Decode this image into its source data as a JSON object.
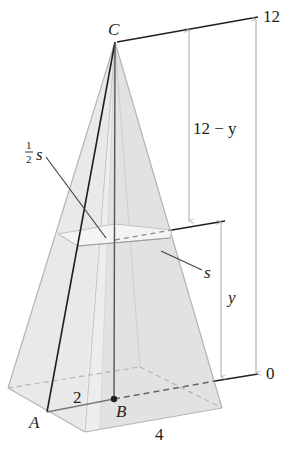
{
  "figure": {
    "labels": {
      "apex": "C",
      "base_corner": "A",
      "base_center": "B",
      "half_base": "2",
      "base_side": "4",
      "cross_section_half_num": "1",
      "cross_section_half_den": "2",
      "cross_section_half_var": "s",
      "cross_section_side": "s",
      "top_level": "12",
      "bottom_level": "0",
      "upper_dim": "12 − y",
      "lower_dim": "y"
    },
    "colors": {
      "face_fill": "#e6e6e6",
      "face_edge": "#b5b5b5",
      "dark_line": "#231f20",
      "dim_line": "#a8a8a8"
    }
  }
}
